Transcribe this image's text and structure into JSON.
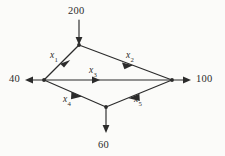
{
  "figure": {
    "type": "network-flow-diagram",
    "background_color": "#fbfbf9",
    "ink_color": "#2b2b2b"
  },
  "nodes": [
    {
      "id": "top",
      "name": "top-node",
      "x": 79,
      "y": 45
    },
    {
      "id": "left",
      "name": "left-node",
      "x": 44,
      "y": 80
    },
    {
      "id": "right",
      "name": "right-node",
      "x": 172,
      "y": 80
    },
    {
      "id": "bottom",
      "name": "bottom-node",
      "x": 106,
      "y": 107
    }
  ],
  "external_flows": [
    {
      "id": "supply-200",
      "label": "200",
      "node": "top",
      "direction": "in",
      "orientation": "down",
      "label_x": 68,
      "label_y": 6
    },
    {
      "id": "demand-40",
      "label": "40",
      "node": "left",
      "direction": "out",
      "orientation": "left",
      "label_x": 9,
      "label_y": 74
    },
    {
      "id": "demand-100",
      "label": "100",
      "node": "right",
      "direction": "out",
      "orientation": "right",
      "label_x": 196,
      "label_y": 74
    },
    {
      "id": "demand-60",
      "label": "60",
      "node": "bottom",
      "direction": "out",
      "orientation": "down",
      "label_x": 98,
      "label_y": 140
    }
  ],
  "arcs": [
    {
      "id": "x1",
      "base": "x",
      "subscript": "1",
      "from": "top",
      "to": "left",
      "label_x": 50,
      "label_y": 51
    },
    {
      "id": "x2",
      "base": "x",
      "subscript": "2",
      "from": "top",
      "to": "right",
      "label_x": 126,
      "label_y": 51
    },
    {
      "id": "x3",
      "base": "x",
      "subscript": "3",
      "from": "left",
      "to": "right",
      "label_x": 89,
      "label_y": 66
    },
    {
      "id": "x4",
      "base": "x",
      "subscript": "4",
      "from": "left",
      "to": "bottom",
      "label_x": 63,
      "label_y": 95
    },
    {
      "id": "x5",
      "base": "x",
      "subscript": "5",
      "from": "right",
      "to": "bottom",
      "label_x": 134,
      "label_y": 95
    }
  ]
}
